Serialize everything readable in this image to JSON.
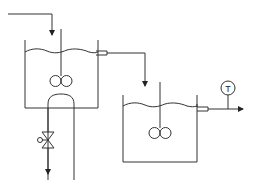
{
  "diagram": {
    "type": "process-flow",
    "colors": {
      "stroke": "#333333",
      "background": "#ffffff"
    },
    "tank1": {
      "label": ""
    },
    "tank2": {
      "label": ""
    },
    "instrument": {
      "symbol": "T",
      "meaning": "temperature indicator"
    },
    "valve": {
      "type": "globe-valve-with-handwheel"
    }
  }
}
